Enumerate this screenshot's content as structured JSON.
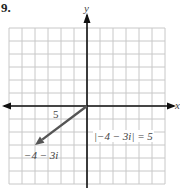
{
  "problem_number": "9.",
  "axes": {
    "x_label": "x",
    "y_label": "y"
  },
  "grid": {
    "x_range": [
      -6,
      6
    ],
    "y_range": [
      -6,
      6
    ],
    "cell_px": 13,
    "origin_px": [
      87,
      106
    ],
    "line_color": "#c8c8c8",
    "axis_color": "#111111"
  },
  "vector": {
    "from": [
      0,
      0
    ],
    "to": [
      -4,
      -3
    ],
    "color": "#555555",
    "length_label": "5",
    "point_label": "−4 − 3i"
  },
  "annotation": {
    "text": "|−4 − 3i| = 5"
  }
}
